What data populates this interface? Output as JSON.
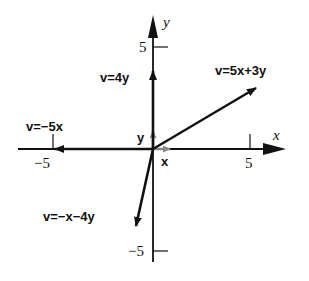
{
  "diagram": {
    "origin_px": [
      153,
      149
    ],
    "unit_px": 20,
    "axes": {
      "x_label": "x",
      "y_label": "y",
      "x_ticks": [
        {
          "value": -5,
          "label": "−5"
        },
        {
          "value": 5,
          "label": "5"
        }
      ],
      "y_ticks": [
        {
          "value": 5,
          "label": "5"
        },
        {
          "value": -5,
          "label": "−5"
        }
      ]
    },
    "basis": {
      "x_label": "x",
      "y_label": "y",
      "color": "#888888"
    },
    "vectors": [
      {
        "name": "v=4y",
        "label": "v=4y",
        "components": [
          0,
          4
        ]
      },
      {
        "name": "v=5x+3y",
        "label": "v=5x+3y",
        "components": [
          5,
          3
        ]
      },
      {
        "name": "v=-5x",
        "label": "v=−5x",
        "components": [
          -5,
          0
        ]
      },
      {
        "name": "v=-x-4y",
        "label": "v=−x−4y",
        "components": [
          -1,
          -4
        ]
      }
    ]
  }
}
